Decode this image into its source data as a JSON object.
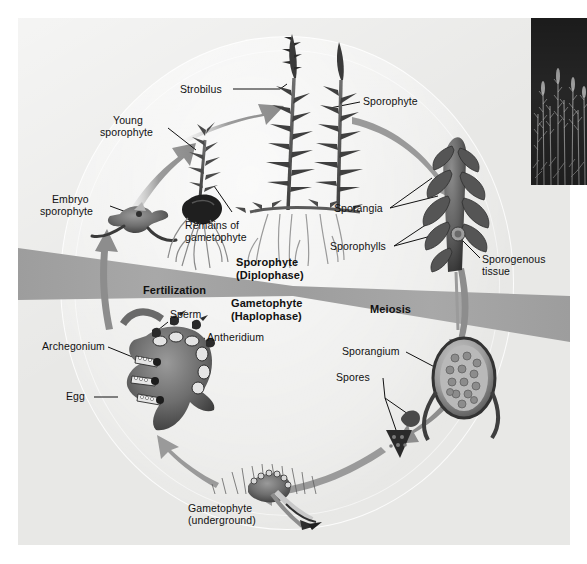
{
  "diagram": {
    "photo": {
      "name": "club-moss-habitat-photo",
      "caption": ""
    },
    "band": {
      "fertilization": "Fertilization",
      "meiosis": "Meiosis",
      "sporophyte_phase": "Sporophyte",
      "sporophyte_phase_sub": "(Diplophase)",
      "gametophyte_phase": "Gametophyte",
      "gametophyte_phase_sub": "(Haplophase)"
    },
    "labels": {
      "strobilus": "Strobilus",
      "sporophyte": "Sporophyte",
      "young_sporophyte_l1": "Young",
      "young_sporophyte_l2": "sporophyte",
      "embryo_sporophyte_l1": "Embryo",
      "embryo_sporophyte_l2": "sporophyte",
      "remains_l1": "Remains of",
      "remains_l2": "gametophyte",
      "sporangia": "Sporangia",
      "sporophylls": "Sporophylls",
      "sporogenous_l1": "Sporogenous",
      "sporogenous_l2": "tissue",
      "sporangium": "Sporangium",
      "spores": "Spores",
      "archegonium": "Archegonium",
      "sperm": "Sperm",
      "antheridium": "Antheridium",
      "egg": "Egg",
      "gametophyte_under_l1": "Gametophyte",
      "gametophyte_under_l2": "(underground)"
    },
    "colors": {
      "page_background": "#ffffff",
      "panel_background": "#e8e8e6",
      "band_gray": "#9a9a9a",
      "arrow_gray": "#8a8a8a",
      "text": "#111111",
      "photo_dark": "#2c2c2c"
    }
  }
}
